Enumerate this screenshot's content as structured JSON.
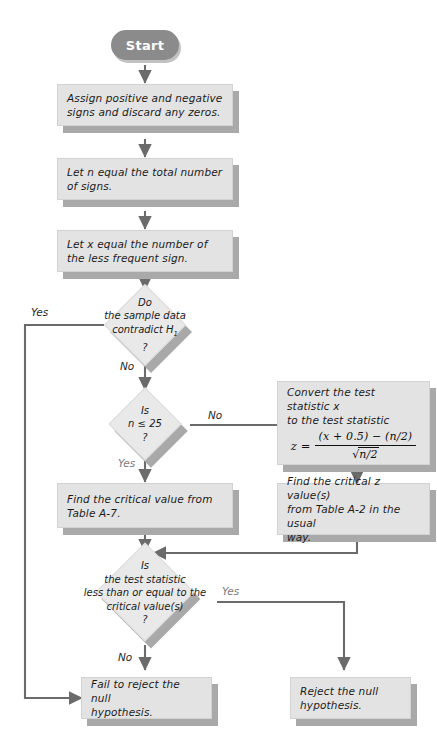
{
  "diagram": {
    "colors": {
      "box_fill": "#e3e3e3",
      "diamond_fill": "#e9e9e9",
      "shadow": "#a9a9a9",
      "start_fill": "#8b8b8b",
      "line": "#6b6b6b",
      "text": "#1b1b1b"
    },
    "nodes": {
      "start": {
        "label": "Start"
      },
      "assign_signs": {
        "line1": "Assign positive and negative",
        "line2": "signs and discard any zeros."
      },
      "let_n": {
        "line1": "Let n equal the total number",
        "line2": "of signs."
      },
      "let_x": {
        "line1": "Let x equal the number of",
        "line2": "the less frequent sign."
      },
      "contradict": {
        "line1": "Do",
        "line2": "the sample data",
        "line3": "contradict H",
        "line3_sub": "1",
        "line4": "?"
      },
      "n_le_25": {
        "line1": "Is",
        "line2": "n ≤ 25",
        "line3": "?"
      },
      "convert": {
        "line1": "Convert the test statistic x",
        "line2": "to the test statistic",
        "formula_lhs": "z =",
        "formula_numerator": "(x + 0.5) − (n/2)",
        "formula_denominator_radicand": "n/2",
        "formula_denominator_symbol": "√",
        "formula_plain": "z = ((x + 0.5) − (n/2)) / √(n/2)"
      },
      "find_a7": {
        "line1": "Find the critical value from",
        "line2": "Table A-7."
      },
      "find_a2": {
        "line1": "Find the critical z value(s)",
        "line2": "from Table A-2 in the usual",
        "line3": "way."
      },
      "test_stat_le": {
        "line1": "Is",
        "line2": "the test statistic",
        "line3": "less than or equal to the",
        "line4": "critical value(s)",
        "line5": "?"
      },
      "fail_reject": {
        "line1": "Fail to reject the null",
        "line2": "hypothesis."
      },
      "reject": {
        "line1": "Reject the null",
        "line2": "hypothesis."
      }
    },
    "edge_labels": {
      "contradict_yes": "Yes",
      "contradict_no": "No",
      "n_le_25_no": "No",
      "n_le_25_yes": "Yes",
      "test_stat_yes": "Yes",
      "test_stat_no": "No"
    }
  }
}
